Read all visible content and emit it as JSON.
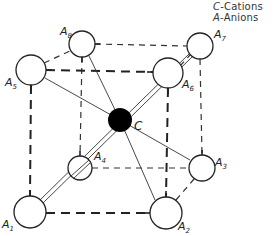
{
  "legend": {
    "cations": {
      "symbol": "C",
      "text": "-Cations"
    },
    "anions": {
      "symbol": "A",
      "text": "-Anions"
    }
  },
  "cation": {
    "label": "C"
  },
  "anions": [
    {
      "id": "A1",
      "label": "A",
      "sub": "1"
    },
    {
      "id": "A2",
      "label": "A",
      "sub": "2"
    },
    {
      "id": "A3",
      "label": "A",
      "sub": "3"
    },
    {
      "id": "A4",
      "label": "A",
      "sub": "4"
    },
    {
      "id": "A5",
      "label": "A",
      "sub": "5"
    },
    {
      "id": "A6",
      "label": "A",
      "sub": "6"
    },
    {
      "id": "A7",
      "label": "A",
      "sub": "7"
    },
    {
      "id": "A8",
      "label": "A",
      "sub": "8"
    }
  ],
  "colors": {
    "cation_fill": "#000000",
    "anion_fill": "#ffffff",
    "stroke": "#222222"
  }
}
